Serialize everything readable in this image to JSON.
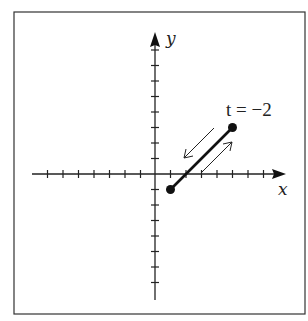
{
  "figure": {
    "frame": {
      "left": 14,
      "top": 12,
      "right": 305,
      "bottom": 314
    },
    "origin": {
      "x": 155,
      "y": 174
    },
    "unit_px": 15.5,
    "x_axis": {
      "label": "x",
      "min_tick": -8,
      "max_tick": 8
    },
    "y_axis": {
      "label": "y",
      "min_tick": -8,
      "max_tick": 8
    },
    "segment": {
      "start": {
        "x": 1,
        "y": -1
      },
      "end": {
        "x": 5,
        "y": 3
      },
      "endpoint_label": "t = −2"
    },
    "direction_arrows": [
      "down-left parallel arrow",
      "up-right parallel arrow"
    ],
    "colors": {
      "ink": "#1a1a1a",
      "background": "#ffffff"
    }
  }
}
